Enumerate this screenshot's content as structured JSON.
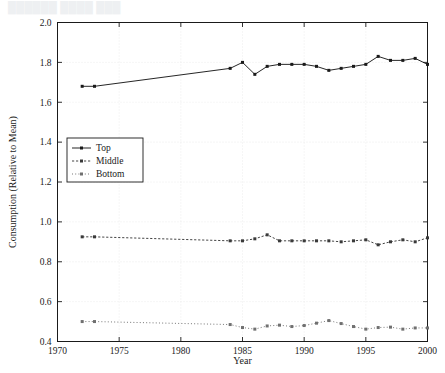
{
  "figure": {
    "faint_header": "██████ ████ ███",
    "background_color": "#ffffff",
    "axis_color": "#1a1a1a",
    "grid_color": "#e8e8e8"
  },
  "legend": {
    "position": "center-left-inside",
    "entries": [
      {
        "label": "Top",
        "style": "solid-line-with-square-markers",
        "color": "#1a1a1a"
      },
      {
        "label": "Middle",
        "style": "dashed-line-with-square-markers",
        "color": "#3a3a3a"
      },
      {
        "label": "Bottom",
        "style": "dotted-line-with-square-markers",
        "color": "#707070"
      }
    ]
  },
  "chart_data": {
    "type": "line",
    "title": "",
    "xlabel": "Year",
    "ylabel": "Consumption (Relative to Mean)",
    "xlim": [
      1970,
      2000
    ],
    "ylim": [
      0.4,
      2.0
    ],
    "xticks": [
      1970,
      1975,
      1980,
      1985,
      1990,
      1995,
      2000
    ],
    "xtick_labels": [
      "1970",
      "1975",
      "1980",
      "1985",
      "1990",
      "1995",
      "2000"
    ],
    "yticks": [
      0.4,
      0.6,
      0.8,
      1.0,
      1.2,
      1.4,
      1.6,
      1.8,
      2.0
    ],
    "ytick_labels": [
      "0.4",
      "0.6",
      "0.8",
      "1.0",
      "1.2",
      "1.4",
      "1.6",
      "1.8",
      "2.0"
    ],
    "grid": true,
    "legend_position": "center left",
    "series": [
      {
        "name": "Top",
        "color": "#1a1a1a",
        "x": [
          1972,
          1973,
          1984,
          1985,
          1986,
          1987,
          1988,
          1989,
          1990,
          1991,
          1992,
          1993,
          1994,
          1995,
          1996,
          1997,
          1998,
          1999,
          2000
        ],
        "values": [
          1.68,
          1.68,
          1.77,
          1.8,
          1.74,
          1.78,
          1.79,
          1.79,
          1.79,
          1.78,
          1.76,
          1.77,
          1.78,
          1.79,
          1.83,
          1.81,
          1.81,
          1.82,
          1.79
        ]
      },
      {
        "name": "Middle",
        "color": "#3a3a3a",
        "x": [
          1972,
          1973,
          1984,
          1985,
          1986,
          1987,
          1988,
          1989,
          1990,
          1991,
          1992,
          1993,
          1994,
          1995,
          1996,
          1997,
          1998,
          1999,
          2000
        ],
        "values": [
          0.925,
          0.925,
          0.905,
          0.905,
          0.915,
          0.935,
          0.905,
          0.905,
          0.905,
          0.905,
          0.905,
          0.9,
          0.905,
          0.91,
          0.885,
          0.9,
          0.91,
          0.9,
          0.92
        ]
      },
      {
        "name": "Bottom",
        "color": "#707070",
        "x": [
          1972,
          1973,
          1984,
          1985,
          1986,
          1987,
          1988,
          1989,
          1990,
          1991,
          1992,
          1993,
          1994,
          1995,
          1996,
          1997,
          1998,
          1999,
          2000
        ],
        "values": [
          0.5,
          0.5,
          0.485,
          0.47,
          0.462,
          0.478,
          0.482,
          0.475,
          0.48,
          0.492,
          0.505,
          0.49,
          0.475,
          0.462,
          0.47,
          0.472,
          0.462,
          0.468,
          0.468
        ]
      }
    ]
  }
}
